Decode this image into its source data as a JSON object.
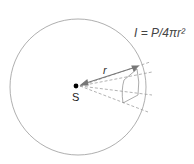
{
  "diagram": {
    "formula_label": "I = P/4πr²",
    "source_label": "S",
    "radius_label": "r",
    "colors": {
      "sphere": "#9a9a9a",
      "arrow": "#777777",
      "dashed": "#a0a0a0",
      "source": "#000000"
    }
  }
}
